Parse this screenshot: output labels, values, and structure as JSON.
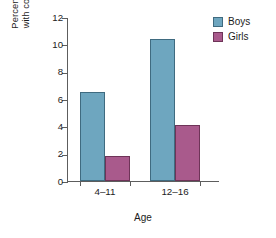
{
  "chart_data": {
    "type": "bar",
    "title": "",
    "subtitle": "",
    "xlabel": "Age",
    "ylabel": "Percentage of children with conduct disorders",
    "ylabel_line1": "Percentage of children",
    "ylabel_line2": "with conduct disorders",
    "categories": [
      "4–11",
      "12–16"
    ],
    "series": [
      {
        "name": "Boys",
        "color": "#6ea6bf",
        "values": [
          6.5,
          10.4
        ]
      },
      {
        "name": "Girls",
        "color": "#a95a8c",
        "values": [
          1.8,
          4.1
        ]
      }
    ],
    "ylim": [
      0,
      12
    ],
    "ytick_values": [
      0,
      2,
      4,
      6,
      8,
      10,
      12
    ],
    "ytick_labels": [
      "0",
      "2",
      "4",
      "6",
      "8",
      "10",
      "12"
    ],
    "grid": false,
    "legend_position": "top-right",
    "legend_entries": [
      "Boys",
      "Girls"
    ]
  },
  "yticks": {
    "t0": "0",
    "t2": "2",
    "t4": "4",
    "t6": "6",
    "t8": "8",
    "t10": "10",
    "t12": "12"
  },
  "xaxis": {
    "title": "Age",
    "group1": "4–11",
    "group2": "12–16"
  },
  "yaxis": {
    "line1": "Percentage of children",
    "line2": "with conduct disorders"
  },
  "legend": {
    "boys": "Boys",
    "girls": "Girls"
  }
}
